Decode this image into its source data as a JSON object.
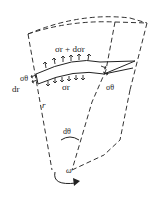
{
  "figure": {
    "type": "rotating disk element free-body diagram",
    "labels": {
      "outer_stress": "σr + dσr",
      "inner_stress": "σr",
      "hoop_left": "σθ",
      "hoop_right": "σθ",
      "thickness": "dr",
      "radius": "r",
      "angle": "dθ",
      "angular_velocity": "ω"
    },
    "colors": {
      "line": "#222222",
      "background": "#ffffff"
    }
  }
}
